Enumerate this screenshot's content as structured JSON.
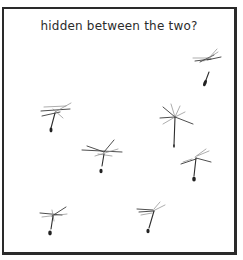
{
  "panel": {
    "caption": "hidden between the two?",
    "border_color": "#2a2a2a",
    "background": "#ffffff"
  },
  "illustration": {
    "subject": "floating dandelion seeds",
    "seed_count": 7
  }
}
